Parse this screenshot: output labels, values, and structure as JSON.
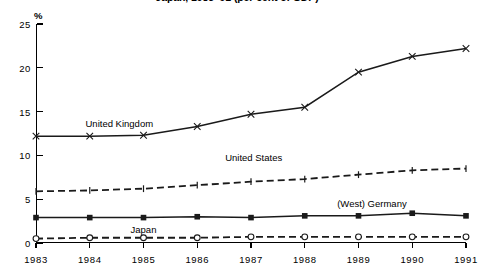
{
  "chart_data": {
    "type": "line",
    "title": "Japan, 1983–91 (per cent of GDP)",
    "xlabel": "",
    "ylabel": "%",
    "x": [
      1983,
      1984,
      1985,
      1986,
      1987,
      1988,
      1989,
      1990,
      1991
    ],
    "categories": [
      "1983",
      "1984",
      "1985",
      "1986",
      "1987",
      "1988",
      "1989",
      "1990",
      "1991"
    ],
    "xlim": [
      1983,
      1991
    ],
    "ylim": [
      0,
      25
    ],
    "yticks": [
      0,
      5,
      10,
      15,
      20,
      25
    ],
    "ytick_labels": [
      "0",
      "5",
      "10",
      "15",
      "20",
      "25"
    ],
    "grid": false,
    "legend": "inline-labels",
    "series": [
      {
        "name": "United Kingdom",
        "marker": "x",
        "line": "solid",
        "color": "#1a1a1a",
        "label_x": 1984.55,
        "label_y": 13.6,
        "values": [
          12.2,
          12.2,
          12.3,
          13.3,
          14.7,
          15.5,
          19.5,
          21.3,
          22.2
        ]
      },
      {
        "name": "United States",
        "marker": "tick",
        "line": "dashed",
        "color": "#1a1a1a",
        "label_x": 1987.05,
        "label_y": 9.7,
        "values": [
          5.9,
          6.0,
          6.2,
          6.6,
          7.0,
          7.3,
          7.8,
          8.3,
          8.5
        ]
      },
      {
        "name": "(West) Germany",
        "marker": "square",
        "line": "solid",
        "color": "#1a1a1a",
        "label_x": 1989.25,
        "label_y": 4.4,
        "values": [
          2.9,
          2.9,
          2.9,
          3.0,
          2.9,
          3.1,
          3.1,
          3.4,
          3.1
        ]
      },
      {
        "name": "Japan",
        "marker": "circle",
        "line": "dashed",
        "color": "#1a1a1a",
        "label_x": 1985.0,
        "label_y": 1.45,
        "values": [
          0.5,
          0.6,
          0.6,
          0.6,
          0.7,
          0.7,
          0.7,
          0.7,
          0.7
        ]
      }
    ]
  }
}
